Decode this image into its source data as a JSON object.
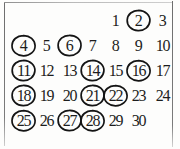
{
  "document": {
    "kind": "scanned-calendar-grid",
    "ink_color": "#141414",
    "text_color": "#1d1d1d",
    "paper_color": "#fdfdfc",
    "rule_color": "#8a8a8a"
  },
  "calendar": {
    "first_day_column_offset": 4,
    "columns": 7,
    "rows": 5,
    "circled_days": [
      2,
      4,
      6,
      11,
      14,
      16,
      18,
      21,
      22,
      25,
      27,
      28
    ],
    "weeks": [
      [
        {
          "label": "",
          "day": null,
          "circled": false
        },
        {
          "label": "",
          "day": null,
          "circled": false
        },
        {
          "label": "",
          "day": null,
          "circled": false
        },
        {
          "label": "",
          "day": null,
          "circled": false
        },
        {
          "label": "1",
          "day": 1,
          "circled": false
        },
        {
          "label": "2",
          "day": 2,
          "circled": true
        },
        {
          "label": "3",
          "day": 3,
          "circled": false
        }
      ],
      [
        {
          "label": "4",
          "day": 4,
          "circled": true
        },
        {
          "label": "5",
          "day": 5,
          "circled": false
        },
        {
          "label": "6",
          "day": 6,
          "circled": true
        },
        {
          "label": "7",
          "day": 7,
          "circled": false
        },
        {
          "label": "8",
          "day": 8,
          "circled": false
        },
        {
          "label": "9",
          "day": 9,
          "circled": false
        },
        {
          "label": "10",
          "day": 10,
          "circled": false
        }
      ],
      [
        {
          "label": "11",
          "day": 11,
          "circled": true
        },
        {
          "label": "12",
          "day": 12,
          "circled": false
        },
        {
          "label": "13",
          "day": 13,
          "circled": false
        },
        {
          "label": "14",
          "day": 14,
          "circled": true
        },
        {
          "label": "15",
          "day": 15,
          "circled": false
        },
        {
          "label": "16",
          "day": 16,
          "circled": true
        },
        {
          "label": "17",
          "day": 17,
          "circled": false
        }
      ],
      [
        {
          "label": "18",
          "day": 18,
          "circled": true
        },
        {
          "label": "19",
          "day": 19,
          "circled": false
        },
        {
          "label": "20",
          "day": 20,
          "circled": false
        },
        {
          "label": "21",
          "day": 21,
          "circled": true
        },
        {
          "label": "22",
          "day": 22,
          "circled": true
        },
        {
          "label": "23",
          "day": 23,
          "circled": false
        },
        {
          "label": "24",
          "day": 24,
          "circled": false
        }
      ],
      [
        {
          "label": "25",
          "day": 25,
          "circled": true
        },
        {
          "label": "26",
          "day": 26,
          "circled": false
        },
        {
          "label": "27",
          "day": 27,
          "circled": true
        },
        {
          "label": "28",
          "day": 28,
          "circled": true
        },
        {
          "label": "29",
          "day": 29,
          "circled": false
        },
        {
          "label": "30",
          "day": 30,
          "circled": false
        }
      ]
    ]
  }
}
